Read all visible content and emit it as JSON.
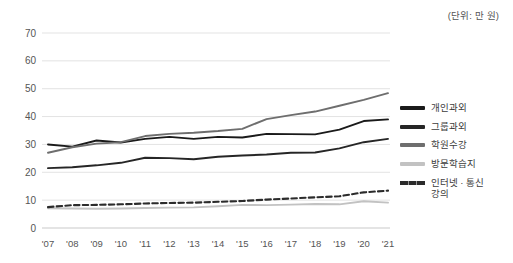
{
  "unit_label": "(단위: 만 원)",
  "legend": {
    "items": [
      {
        "label": "개인과외",
        "color": "#1a1a1a",
        "dashed": false
      },
      {
        "label": "그룹과외",
        "color": "#262626",
        "dashed": false
      },
      {
        "label": "학원수강",
        "color": "#6e6e6e",
        "dashed": false
      },
      {
        "label": "방문학습지",
        "color": "#c2c2c2",
        "dashed": false
      },
      {
        "label": "인터넷 · 통신\n강의",
        "color": "#2b2b2b",
        "dashed": true
      }
    ]
  },
  "chart_data": {
    "type": "line",
    "title": "",
    "xlabel": "",
    "ylabel": "",
    "unit": "만 원",
    "ylim": [
      0,
      70
    ],
    "yticks": [
      0,
      10,
      20,
      30,
      40,
      50,
      60,
      70
    ],
    "grid": true,
    "legend_position": "right",
    "categories": [
      "'07",
      "'08",
      "'09",
      "'10",
      "'11",
      "'12",
      "'13",
      "'14",
      "'15",
      "'16",
      "'17",
      "'18",
      "'19",
      "'20",
      "'21"
    ],
    "series": [
      {
        "name": "개인과외",
        "color": "#1a1a1a",
        "style": "solid",
        "values": [
          30.0,
          29.2,
          31.4,
          30.7,
          32.0,
          32.7,
          32.0,
          32.7,
          32.5,
          33.8,
          33.7,
          33.6,
          35.3,
          38.4,
          39.0
        ]
      },
      {
        "name": "그룹과외",
        "color": "#262626",
        "style": "solid",
        "values": [
          21.5,
          21.8,
          22.5,
          23.4,
          25.2,
          25.1,
          24.7,
          25.6,
          26.0,
          26.4,
          27.0,
          27.1,
          28.6,
          30.8,
          32.0
        ]
      },
      {
        "name": "학원수강",
        "color": "#6e6e6e",
        "style": "solid",
        "values": [
          27.0,
          29.0,
          30.3,
          30.8,
          33.0,
          33.8,
          34.2,
          34.8,
          35.6,
          39.1,
          40.5,
          41.8,
          43.9,
          46.0,
          48.4
        ]
      },
      {
        "name": "방문학습지",
        "color": "#c2c2c2",
        "style": "solid",
        "values": [
          7.1,
          7.0,
          6.9,
          7.0,
          7.2,
          7.3,
          7.4,
          7.8,
          8.3,
          8.2,
          8.4,
          8.6,
          8.5,
          9.6,
          9.1
        ]
      },
      {
        "name": "인터넷 · 통신 강의",
        "color": "#2b2b2b",
        "style": "dashed",
        "values": [
          7.5,
          8.2,
          8.3,
          8.5,
          8.8,
          9.0,
          9.1,
          9.4,
          9.7,
          10.2,
          10.6,
          11.0,
          11.4,
          12.8,
          13.4
        ]
      }
    ]
  }
}
